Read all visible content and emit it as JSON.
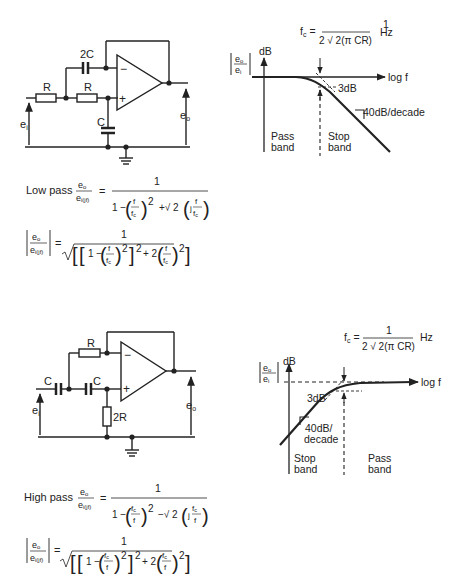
{
  "lowpass": {
    "circuit": {
      "label_2c": "2C",
      "label_r1": "R",
      "label_r2": "R",
      "label_c": "C",
      "label_minus": "−",
      "label_plus": "+",
      "label_ei": "e",
      "label_ei_sub": "i",
      "label_eo": "e",
      "label_eo_sub": "o"
    },
    "graph": {
      "fc_lhs": "f",
      "fc_lhs_sub": "c",
      "fc_eq": "=",
      "fc_num": "1",
      "fc_den": "2 √ 2(π CR)",
      "fc_unit": "Hz",
      "y_num": "e",
      "y_num_sub": "o",
      "y_den": "e",
      "y_den_sub": "i",
      "y_unit": "dB",
      "x_label": "log f",
      "drop_label": "3dB",
      "slope_label": "40dB/decade",
      "band_left_1": "Pass",
      "band_left_2": "band",
      "band_right_1": "Stop",
      "band_right_2": "band"
    },
    "formula": {
      "title": "Low pass",
      "tf_num": "e",
      "tf_num_sub": "o",
      "tf_den": "e",
      "tf_den_sub": "i(jf)",
      "eq": "=",
      "one": "1",
      "den_text": "1 − (f/f",
      "den_a_1": "1 −",
      "den_a_f": "f",
      "den_a_fc": "f",
      "den_a_fc_sub": "c",
      "den_a_pow": "2",
      "den_b_sign": "+√ 2",
      "den_b_j": "j",
      "den_b_f": "f",
      "den_b_fc": "f",
      "den_b_fc_sub": "c",
      "mag_one": "1",
      "mag_1": "1 −",
      "mag_f": "f",
      "mag_fc": "f",
      "mag_fc_sub": "c",
      "mag_pow": "2",
      "mag_pow2": "2",
      "mag_plus2": "+ 2",
      "mag_f2": "f",
      "mag_fc2": "f",
      "mag_fc2_sub": "c",
      "mag_pow3": "2"
    }
  },
  "highpass": {
    "circuit": {
      "label_r": "R",
      "label_c1": "C",
      "label_c2": "C",
      "label_2r": "2R",
      "label_minus": "−",
      "label_plus": "+",
      "label_ei": "e",
      "label_ei_sub": "i",
      "label_eo": "e",
      "label_eo_sub": "o"
    },
    "graph": {
      "fc_lhs": "f",
      "fc_lhs_sub": "c",
      "fc_eq": "=",
      "fc_num": "1",
      "fc_den": "2 √ 2(π CR)",
      "fc_unit": "Hz",
      "y_num": "e",
      "y_num_sub": "o",
      "y_den": "e",
      "y_den_sub": "i",
      "y_unit": "dB",
      "x_label": "log f",
      "drop_label": "3dB",
      "slope_label_1": "40dB/",
      "slope_label_2": "decade",
      "band_left_1": "Stop",
      "band_left_2": "band",
      "band_right_1": "Pass",
      "band_right_2": "band"
    },
    "formula": {
      "title": "High pass",
      "tf_num": "e",
      "tf_num_sub": "o",
      "tf_den": "e",
      "tf_den_sub": "i(jf)",
      "eq": "=",
      "one": "1",
      "den_a_1": "1 −",
      "den_a_fc": "f",
      "den_a_fc_sub": "c",
      "den_a_f": "f",
      "den_a_pow": "2",
      "den_b_sign": "−√ 2",
      "den_b_j": "j",
      "den_b_fc": "f",
      "den_b_fc_sub": "c",
      "den_b_f": "f",
      "mag_one": "1",
      "mag_1": "1 −",
      "mag_fc": "f",
      "mag_fc_sub": "c",
      "mag_f": "f",
      "mag_pow": "2",
      "mag_pow2": "2",
      "mag_plus2": "+ 2",
      "mag_fc2": "f",
      "mag_fc2_sub": "c",
      "mag_f2": "f",
      "mag_pow3": "2"
    }
  }
}
